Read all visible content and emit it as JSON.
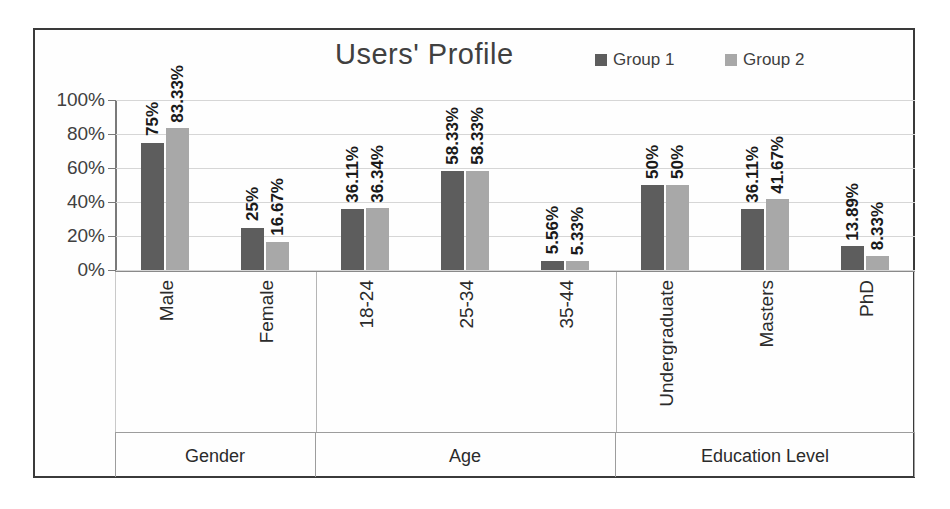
{
  "chart_data": {
    "type": "bar",
    "title": "Users' Profile",
    "xlabel": "",
    "ylabel": "",
    "ylim": [
      0,
      100
    ],
    "ytick_labels": [
      "100%",
      "80%",
      "60%",
      "40%",
      "20%",
      "0%"
    ],
    "ytick_values": [
      100,
      80,
      60,
      40,
      20,
      0
    ],
    "grid": true,
    "legend_position": "top-right",
    "categories": [
      "Male",
      "Female",
      "18-24",
      "25-34",
      "35-44",
      "Undergraduate",
      "Masters",
      "PhD"
    ],
    "groups": [
      {
        "name": "Gender",
        "categories": [
          "Male",
          "Female"
        ]
      },
      {
        "name": "Age",
        "categories": [
          "18-24",
          "25-34",
          "35-44"
        ]
      },
      {
        "name": "Education Level",
        "categories": [
          "Undergraduate",
          "Masters",
          "PhD"
        ]
      }
    ],
    "series": [
      {
        "name": "Group 1",
        "color": "#5d5d5d",
        "values": [
          75,
          25,
          36.11,
          58.33,
          5.56,
          50,
          36.11,
          13.89
        ],
        "labels": [
          "75%",
          "25%",
          "36.11%",
          "58.33%",
          "5.56%",
          "50%",
          "36.11%",
          "13.89%"
        ]
      },
      {
        "name": "Group 2",
        "color": "#a8a8a8",
        "values": [
          83.33,
          16.67,
          36.34,
          58.33,
          5.33,
          50,
          41.67,
          8.33
        ],
        "labels": [
          "83.33%",
          "16.67%",
          "36.34%",
          "58.33%",
          "5.33%",
          "50%",
          "41.67%",
          "8.33%"
        ]
      }
    ]
  },
  "legend": {
    "items": [
      {
        "label": "Group 1",
        "color": "#5d5d5d"
      },
      {
        "label": "Group 2",
        "color": "#a8a8a8"
      }
    ]
  }
}
